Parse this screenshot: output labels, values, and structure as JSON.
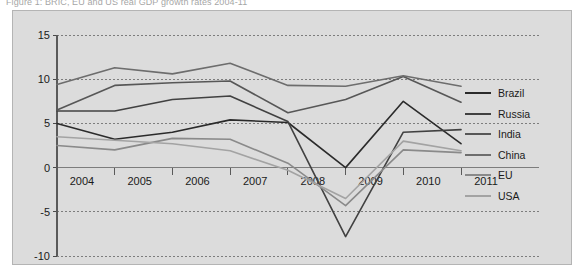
{
  "figure": {
    "title": "Figure 1: BRIC, EU and US real GDP growth rates 2004-11"
  },
  "legend": {
    "position": "right",
    "entries": [
      {
        "label": "Brazil",
        "color": "#2b2b2b"
      },
      {
        "label": "Russia",
        "color": "#414141"
      },
      {
        "label": "India",
        "color": "#575757"
      },
      {
        "label": "China",
        "color": "#6d6d6d"
      },
      {
        "label": "EU",
        "color": "#8a8a8a"
      },
      {
        "label": "USA",
        "color": "#a3a3a3"
      }
    ]
  },
  "chart_data": {
    "type": "line",
    "title": "Figure 1: BRIC, EU and US real GDP growth rates 2004-11",
    "xlabel": "",
    "ylabel": "",
    "x": [
      2004,
      2005,
      2006,
      2007,
      2008,
      2009,
      2010,
      2011
    ],
    "categories": [
      "2004",
      "2005",
      "2006",
      "2007",
      "2008",
      "2009",
      "2010",
      "2011"
    ],
    "ylim": [
      -10,
      15
    ],
    "yticks": [
      15,
      10,
      5,
      0,
      -5,
      -10
    ],
    "ytick_labels": [
      "15",
      "10",
      "5",
      "0",
      "-5",
      "-10"
    ],
    "grid": true,
    "grid_style": "dotted-horizontal",
    "legend_position": "right",
    "series": [
      {
        "name": "Brazil",
        "color": "#2b2b2b",
        "values": [
          5.0,
          3.2,
          4.0,
          5.4,
          5.1,
          0.0,
          7.5,
          2.7
        ]
      },
      {
        "name": "Russia",
        "color": "#414141",
        "values": [
          6.4,
          6.4,
          7.7,
          8.1,
          5.2,
          -7.8,
          4.0,
          4.3
        ]
      },
      {
        "name": "India",
        "color": "#575757",
        "values": [
          6.5,
          9.3,
          9.6,
          9.8,
          6.2,
          7.7,
          10.3,
          7.4
        ]
      },
      {
        "name": "China",
        "color": "#6d6d6d",
        "values": [
          9.4,
          11.3,
          10.6,
          11.8,
          9.3,
          9.2,
          10.4,
          9.2
        ]
      },
      {
        "name": "EU",
        "color": "#8a8a8a",
        "values": [
          2.5,
          2.0,
          3.3,
          3.2,
          0.5,
          -4.3,
          2.0,
          1.7
        ]
      },
      {
        "name": "USA",
        "color": "#a3a3a3",
        "values": [
          3.5,
          3.1,
          2.7,
          1.9,
          -0.3,
          -3.5,
          3.0,
          1.9
        ]
      }
    ]
  },
  "axis": {
    "y_labels": [
      "15",
      "10",
      "5",
      "0",
      "-5",
      "-10"
    ],
    "x_labels": [
      "2004",
      "2005",
      "2006",
      "2007",
      "2008",
      "2009",
      "2010",
      "2011"
    ]
  }
}
